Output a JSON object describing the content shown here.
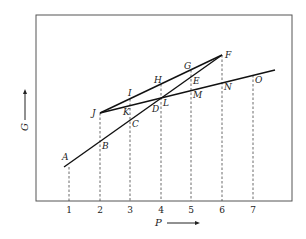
{
  "diagram": {
    "frame": {
      "x1": 36,
      "y1": 15,
      "x2": 292,
      "y2": 201,
      "color": "#555555"
    },
    "x_axis": {
      "label": "P",
      "ticks": [
        {
          "label": "1",
          "x": 69
        },
        {
          "label": "2",
          "x": 100
        },
        {
          "label": "3",
          "x": 130
        },
        {
          "label": "4",
          "x": 161
        },
        {
          "label": "5",
          "x": 191
        },
        {
          "label": "6",
          "x": 222
        },
        {
          "label": "7",
          "x": 253
        }
      ]
    },
    "y_axis": {
      "label": "G"
    },
    "lines": [
      {
        "name": "line-a-f",
        "x1": 64,
        "y1": 167,
        "x2": 222,
        "y2": 55
      },
      {
        "name": "line-j-f",
        "x1": 100,
        "y1": 113,
        "x2": 222,
        "y2": 55
      },
      {
        "name": "line-j-o",
        "x1": 100,
        "y1": 113,
        "x2": 275,
        "y2": 70
      }
    ],
    "dashed_verticals": [
      {
        "x": 69,
        "y_top": 167
      },
      {
        "x": 100,
        "y_top": 113
      },
      {
        "x": 130,
        "y_top": 99
      },
      {
        "x": 161,
        "y_top": 84
      },
      {
        "x": 191,
        "y_top": 70
      },
      {
        "x": 222,
        "y_top": 55
      },
      {
        "x": 253,
        "y_top": 75
      }
    ],
    "points": [
      {
        "label": "A",
        "x": 62,
        "y": 160
      },
      {
        "label": "B",
        "x": 102,
        "y": 149
      },
      {
        "label": "C",
        "x": 132,
        "y": 127
      },
      {
        "label": "D",
        "x": 152,
        "y": 112
      },
      {
        "label": "E",
        "x": 193,
        "y": 84
      },
      {
        "label": "F",
        "x": 225,
        "y": 58
      },
      {
        "label": "G",
        "x": 184,
        "y": 69
      },
      {
        "label": "H",
        "x": 154,
        "y": 83
      },
      {
        "label": "I",
        "x": 128,
        "y": 96
      },
      {
        "label": "J",
        "x": 92,
        "y": 116
      },
      {
        "label": "K",
        "x": 123,
        "y": 115
      },
      {
        "label": "L",
        "x": 163,
        "y": 106
      },
      {
        "label": "M",
        "x": 193,
        "y": 98
      },
      {
        "label": "N",
        "x": 224,
        "y": 90
      },
      {
        "label": "O",
        "x": 255,
        "y": 83
      }
    ]
  }
}
